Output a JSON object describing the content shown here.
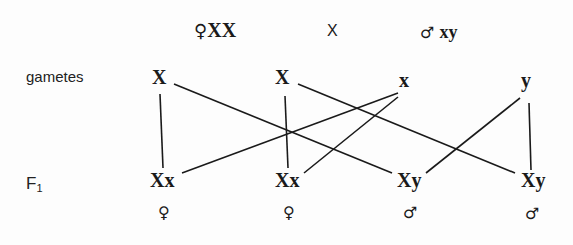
{
  "parents": {
    "female": {
      "symbol": "♀",
      "genotype": "XX"
    },
    "cross": "X",
    "male": {
      "symbol": "♂",
      "genotype": "xy"
    }
  },
  "rows": {
    "gametes_label": "gametes",
    "f1_label": "F",
    "f1_sub": "1"
  },
  "gametes": [
    "X",
    "X",
    "x",
    "y"
  ],
  "offspring": [
    {
      "genotype": "Xx",
      "sex": "♀"
    },
    {
      "genotype": "Xx",
      "sex": "♀"
    },
    {
      "genotype": "Xy",
      "sex": "♂"
    },
    {
      "genotype": "Xy",
      "sex": "♂"
    }
  ],
  "connections": [
    {
      "from": "gamete-0",
      "to": "offspring-0"
    },
    {
      "from": "gamete-0",
      "to": "offspring-2"
    },
    {
      "from": "gamete-1",
      "to": "offspring-1"
    },
    {
      "from": "gamete-1",
      "to": "offspring-3"
    },
    {
      "from": "gamete-2",
      "to": "offspring-0"
    },
    {
      "from": "gamete-2",
      "to": "offspring-1"
    },
    {
      "from": "gamete-3",
      "to": "offspring-2"
    },
    {
      "from": "gamete-3",
      "to": "offspring-3"
    }
  ]
}
